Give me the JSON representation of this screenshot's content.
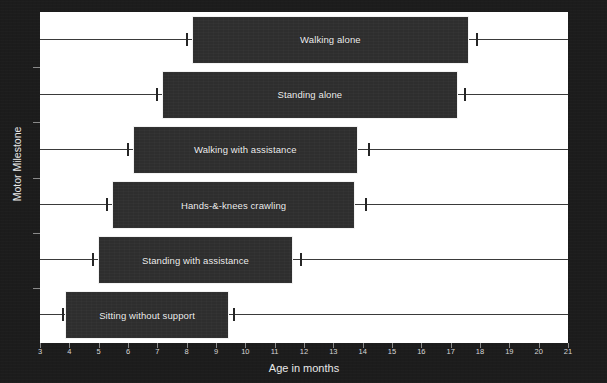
{
  "chart_data": {
    "type": "bar",
    "title": "",
    "subtitle": "",
    "xlabel": "Age in months",
    "ylabel": "Motor Milestone",
    "xlim": [
      3,
      21
    ],
    "xticks": [
      3,
      4,
      5,
      6,
      7,
      8,
      9,
      10,
      11,
      12,
      13,
      14,
      15,
      16,
      17,
      18,
      19,
      20,
      21
    ],
    "xtick_labels": [
      "3",
      "4",
      "5",
      "6",
      "7",
      "8",
      "9",
      "10",
      "11",
      "12",
      "13",
      "14",
      "15",
      "16",
      "17",
      "18",
      "19",
      "20",
      "21"
    ],
    "grid": false,
    "legend": null,
    "orientation": "horizontal",
    "categories": [
      "Walking alone",
      "Standing alone",
      "Walking with assistance",
      "Hands-&-knees crawling",
      "Standing with assistance",
      "Sitting without support"
    ],
    "series": [
      {
        "name": "Box range (months)",
        "ranges": [
          [
            8.2,
            17.6
          ],
          [
            7.2,
            17.2
          ],
          [
            6.2,
            13.8
          ],
          [
            5.5,
            13.7
          ],
          [
            5.0,
            11.6
          ],
          [
            3.9,
            9.4
          ]
        ]
      },
      {
        "name": "Whisker range (months)",
        "ranges": [
          [
            8.0,
            17.9
          ],
          [
            7.0,
            17.5
          ],
          [
            6.0,
            14.2
          ],
          [
            5.3,
            14.1
          ],
          [
            4.8,
            11.9
          ],
          [
            3.8,
            9.6
          ]
        ]
      }
    ],
    "rows": [
      {
        "label": "Walking alone",
        "box_start": 8.2,
        "box_end": 17.6,
        "whisker_low": 8.0,
        "whisker_high": 17.9
      },
      {
        "label": "Standing alone",
        "box_start": 7.2,
        "box_end": 17.2,
        "whisker_low": 7.0,
        "whisker_high": 17.5
      },
      {
        "label": "Walking with assistance",
        "box_start": 6.2,
        "box_end": 13.8,
        "whisker_low": 6.0,
        "whisker_high": 14.2
      },
      {
        "label": "Hands-&-knees crawling",
        "box_start": 5.5,
        "box_end": 13.7,
        "whisker_low": 5.3,
        "whisker_high": 14.1
      },
      {
        "label": "Standing with assistance",
        "box_start": 5.0,
        "box_end": 11.6,
        "whisker_low": 4.8,
        "whisker_high": 11.9
      },
      {
        "label": "Sitting without support",
        "box_start": 3.9,
        "box_end": 9.4,
        "whisker_low": 3.8,
        "whisker_high": 9.6
      }
    ],
    "colors": {
      "background": "#1c1c1c",
      "plot_background": "#ffffff",
      "box_fill": "#2e2e2e",
      "box_edge": "#f2f2f2",
      "whisker": "#3a3a3a",
      "box_label_text": "#f0f0f0",
      "axis_text": "#e8e8e8",
      "tick": "#8a8a8a"
    }
  }
}
